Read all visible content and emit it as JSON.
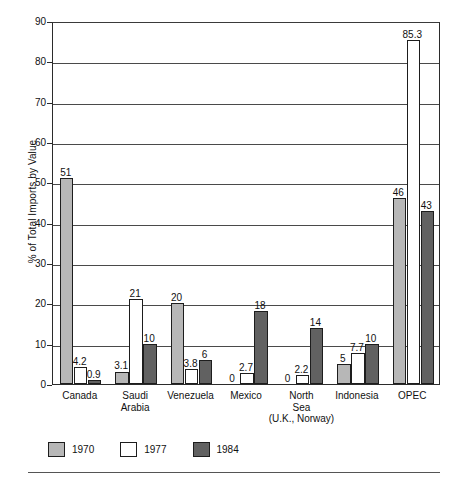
{
  "chart_data": {
    "type": "bar",
    "title": "",
    "subtitle": "",
    "xlabel": "",
    "ylabel": "% of Total Imports by Value",
    "ylim": [
      0,
      90
    ],
    "yticks": [
      0,
      10,
      20,
      30,
      40,
      50,
      60,
      70,
      80,
      90
    ],
    "ytick_labels": [
      "0",
      "10",
      "20",
      "30",
      "40",
      "50",
      "60",
      "70",
      "80",
      "90"
    ],
    "grid": true,
    "grid_axis": "y",
    "legend_position": "bottom-left",
    "categories": [
      "Canada",
      "Saudi\nArabia",
      "Venezuela",
      "Mexico",
      "North\nSea\n(U.K., Norway)",
      "Indonesia",
      "OPEC"
    ],
    "series": [
      {
        "name": "1970",
        "color": "#b7b7b7",
        "values": [
          51,
          3.1,
          20,
          0,
          0,
          5,
          46
        ],
        "labels": [
          "51",
          "3.1",
          "20",
          "0",
          "0",
          "5",
          "46"
        ]
      },
      {
        "name": "1977",
        "color": "#ffffff",
        "values": [
          4.2,
          21,
          3.8,
          2.7,
          2.2,
          7.7,
          85.3
        ],
        "labels": [
          "4.2",
          "21",
          "3.8",
          "2.7",
          "2.2",
          "7.7",
          "85.3"
        ]
      },
      {
        "name": "1984",
        "color": "#616161",
        "values": [
          0.9,
          10,
          6,
          18,
          14,
          10,
          43
        ],
        "labels": [
          "0.9",
          "10",
          "6",
          "18",
          "14",
          "10",
          "43"
        ]
      }
    ]
  },
  "legend": {
    "items": [
      {
        "label": "1970",
        "swatch": "y1970"
      },
      {
        "label": "1977",
        "swatch": "y1977"
      },
      {
        "label": "1984",
        "swatch": "y1984"
      }
    ]
  },
  "axis": {
    "y_title": "% of Total Imports by Value"
  }
}
